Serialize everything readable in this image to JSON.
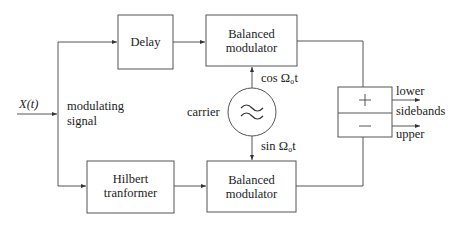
{
  "diagram": {
    "input": {
      "symbol": "X(t)",
      "label_line1": "modulating",
      "label_line2": "signal"
    },
    "blocks": {
      "delay": {
        "label": "Delay"
      },
      "hilbert": {
        "line1": "Hilbert",
        "line2": "tranformer"
      },
      "mod_top": {
        "line1": "Balanced",
        "line2": "modulator"
      },
      "mod_bottom": {
        "line1": "Balanced",
        "line2": "modulator"
      },
      "carrier": {
        "label": "carrier",
        "symbol": "≈"
      },
      "summer": {
        "plus": "+",
        "minus": "−"
      }
    },
    "signals": {
      "cos": "cos Ω₀t",
      "sin": "sin Ω₀t"
    },
    "outputs": {
      "lower": "lower",
      "sidebands": "sidebands",
      "upper": "upper"
    },
    "colors": {
      "stroke": "#444444",
      "text": "#222222",
      "background": "#ffffff"
    }
  }
}
